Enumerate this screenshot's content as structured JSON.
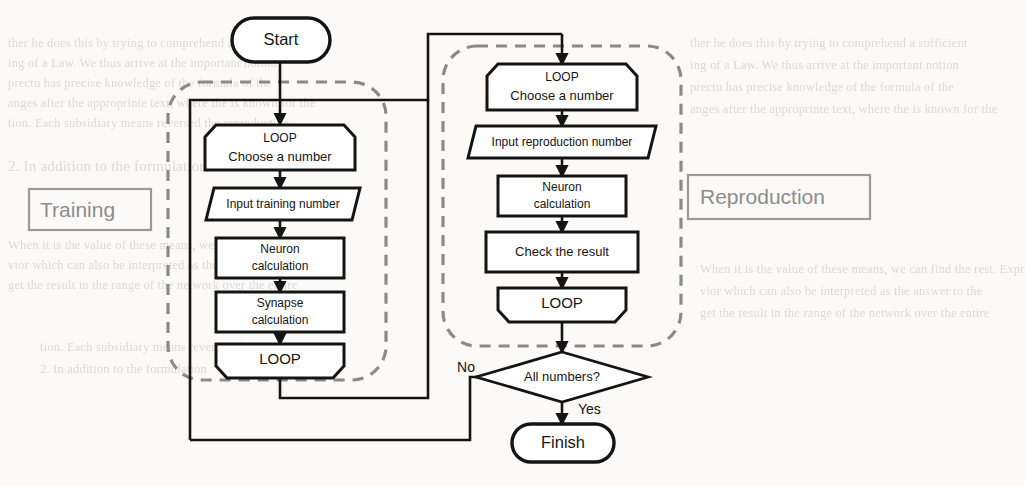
{
  "figure": {
    "type": "flowchart",
    "background_color": "#fbfaf8",
    "stroke_color": "#141414",
    "dashed_group_color": "#8a8a8a",
    "tag_color": "#8d8d8d"
  },
  "terminals": {
    "start": "Start",
    "finish": "Finish"
  },
  "groups": {
    "training": {
      "label": "Training",
      "style": "dashed-rounded"
    },
    "reproduction": {
      "label": "Reproduction",
      "style": "dashed-rounded"
    }
  },
  "training_steps": [
    {
      "id": "t-loop-open",
      "shape": "loop-start",
      "line1": "LOOP",
      "line2": "Choose a number"
    },
    {
      "id": "t-input",
      "shape": "parallelogram",
      "line1": "Input training number",
      "line2": ""
    },
    {
      "id": "t-neuron",
      "shape": "rect",
      "line1": "Neuron",
      "line2": "calculation"
    },
    {
      "id": "t-synapse",
      "shape": "rect",
      "line1": "Synapse",
      "line2": "calculation"
    },
    {
      "id": "t-loop-close",
      "shape": "loop-end",
      "line1": "LOOP",
      "line2": ""
    }
  ],
  "reproduction_steps": [
    {
      "id": "r-loop-open",
      "shape": "loop-start",
      "line1": "LOOP",
      "line2": "Choose a number"
    },
    {
      "id": "r-input",
      "shape": "parallelogram",
      "line1": "Input reproduction number",
      "line2": ""
    },
    {
      "id": "r-neuron",
      "shape": "rect",
      "line1": "Neuron",
      "line2": "calculation"
    },
    {
      "id": "r-check",
      "shape": "rect",
      "line1": "Check the result",
      "line2": ""
    },
    {
      "id": "r-loop-close",
      "shape": "loop-end",
      "line1": "LOOP",
      "line2": ""
    }
  ],
  "decision": {
    "label": "All numbers?",
    "branch_no": "No",
    "branch_yes": "Yes"
  },
  "background_ghost_text": [
    "ther he does this by trying to comprehend a sufficient",
    "ing of a Law. We thus arrive at the important notion",
    "prectu has precise knowledge of the formula of the",
    "anges after the approprinte text, where the is known for the",
    "tion. Each subsidiary means reversed the reproductive",
    "2. In addition to the formulation",
    "When it is the value of these means, we can find the rest. Expr",
    "vior which can also be interpreted as the answer to the",
    "get the result in the range of the network over the entire"
  ]
}
